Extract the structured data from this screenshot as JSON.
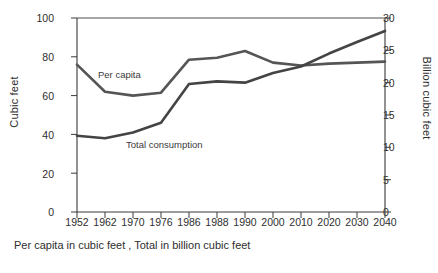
{
  "chart_data": {
    "type": "line",
    "title": "",
    "subtitle": "",
    "caption": "Per capita in cubic feet , Total in billion cubic feet",
    "xlabel": "",
    "ylabel": "Cubic feet",
    "ylabel_right": "Billion cubic feet",
    "categories": [
      "1952",
      "1962",
      "1970",
      "1976",
      "1986",
      "1988",
      "1990",
      "2000",
      "2010",
      "2020",
      "2030",
      "2040"
    ],
    "ylim": [
      0,
      100
    ],
    "yticks": [
      "0",
      "20",
      "40",
      "60",
      "80",
      "100"
    ],
    "ylim_right": [
      0,
      30
    ],
    "yticks_right": [
      "0",
      "5",
      "10",
      "15",
      "20",
      "25",
      "30"
    ],
    "grid": false,
    "legend_position": "inline-annotations",
    "series": [
      {
        "name": "Per capita",
        "axis": "left",
        "units": "cubic feet",
        "color": "#555555",
        "values": [
          76,
          62,
          60,
          61.5,
          78.5,
          79.5,
          83,
          77,
          75.5,
          76.5,
          77,
          77.5
        ]
      },
      {
        "name": "Total consumption",
        "axis": "right",
        "units": "billion cubic feet",
        "color": "#444444",
        "values": [
          11.8,
          11.4,
          12.3,
          13.8,
          19.8,
          20.2,
          20,
          21.5,
          22.5,
          24.5,
          26.3,
          28
        ]
      }
    ],
    "annotations": [
      {
        "text": "Per capita",
        "x": "1970",
        "y": 68
      },
      {
        "text": "Total consumption",
        "x": "1980",
        "y": 45
      }
    ]
  },
  "axis": {
    "left_title": "Cubic feet",
    "right_title": "Billion cubic feet",
    "left_ticks": [
      "100",
      "80",
      "60",
      "40",
      "20",
      "0"
    ],
    "right_ticks": [
      "30",
      "25",
      "20",
      "15",
      "10",
      "5",
      "0"
    ],
    "x_ticks": [
      "1952",
      "1962",
      "1970",
      "1976",
      "1986",
      "1988",
      "1990",
      "2000",
      "2010",
      "2020",
      "2030",
      "2040"
    ]
  },
  "labels": {
    "per_capita": "Per capita",
    "total_consumption": "Total consumption",
    "caption": "Per capita in cubic feet , Total in billion cubic feet"
  },
  "colors": {
    "line": "#4a4a4a",
    "axis": "#3a3a3a",
    "text": "#2e2e2e",
    "background": "#ffffff"
  }
}
